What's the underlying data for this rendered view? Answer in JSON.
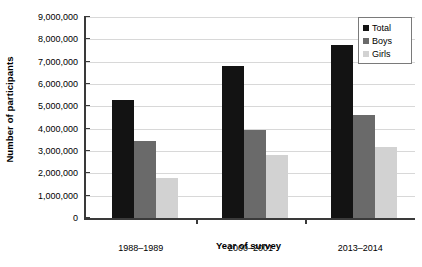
{
  "chart_data": {
    "type": "bar",
    "title": "",
    "xlabel": "Year of survey",
    "ylabel": "Number of participants",
    "categories": [
      "1988–1989",
      "2000–2001",
      "2013–2014"
    ],
    "series": [
      {
        "name": "Total",
        "color": "#131313",
        "values": [
          5300000,
          6800000,
          7750000
        ]
      },
      {
        "name": "Boys",
        "color": "#6a6a6a",
        "values": [
          3450000,
          3950000,
          4600000
        ]
      },
      {
        "name": "Girls",
        "color": "#d2d2d2",
        "values": [
          1800000,
          2800000,
          3200000
        ]
      }
    ],
    "ylim": [
      0,
      9000000
    ],
    "ytick_values": [
      0,
      1000000,
      2000000,
      3000000,
      4000000,
      5000000,
      6000000,
      7000000,
      8000000,
      9000000
    ],
    "ytick_labels": [
      "0",
      "1,000,000",
      "2,000,000",
      "3,000,000",
      "4,000,000",
      "5,000,000",
      "6,000,000",
      "7,000,000",
      "8,000,000",
      "9,000,000"
    ],
    "grid": true,
    "legend_position": "top-right"
  },
  "legend": {
    "items": [
      {
        "label": "Total",
        "color": "#131313"
      },
      {
        "label": "Boys",
        "color": "#6a6a6a"
      },
      {
        "label": "Girls",
        "color": "#d2d2d2"
      }
    ]
  },
  "axes": {
    "y_title": "Number of participants",
    "x_title": "Year of survey"
  }
}
